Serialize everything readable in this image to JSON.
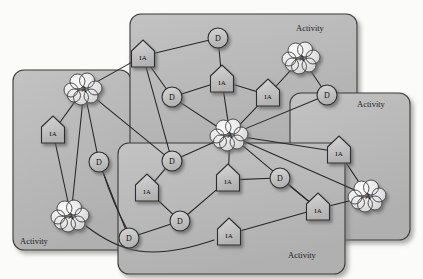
{
  "diagram": {
    "legend_terms": {
      "agent": "A",
      "information_asset": "IA",
      "data": "D"
    },
    "colors": {
      "panel_fill": "#b9b9b9",
      "panel_stroke": "#3a3a3a",
      "node_fill": "#c4c4c4",
      "cloud_fill": "#e9e9e9",
      "edge": "#262626",
      "text": "#111111",
      "background": "#fbfbf9"
    },
    "panels": [
      {
        "id": "p-left",
        "label": "Activity",
        "x": 13,
        "y": 70,
        "w": 118,
        "h": 180,
        "label_x": 20,
        "label_y": 244
      },
      {
        "id": "p-top",
        "label": "Activity",
        "x": 130,
        "y": 14,
        "w": 227,
        "h": 148,
        "label_x": 296,
        "label_y": 31
      },
      {
        "id": "p-right",
        "label": "Activity",
        "x": 290,
        "y": 93,
        "w": 120,
        "h": 147,
        "label_x": 357,
        "label_y": 107
      },
      {
        "id": "p-bottom",
        "label": "Activity",
        "x": 118,
        "y": 143,
        "w": 227,
        "h": 131,
        "label_x": 288,
        "label_y": 258
      }
    ],
    "nodes": [
      {
        "id": "n1",
        "type": "cloud",
        "label": "A",
        "x": 84,
        "y": 89
      },
      {
        "id": "n2",
        "type": "pentagon",
        "label": "IA",
        "x": 53,
        "y": 132
      },
      {
        "id": "n3",
        "type": "circle",
        "label": "D",
        "x": 99,
        "y": 162
      },
      {
        "id": "n4",
        "type": "cloud",
        "label": "A",
        "x": 71,
        "y": 216
      },
      {
        "id": "n5",
        "type": "pentagon",
        "label": "IA",
        "x": 143,
        "y": 56
      },
      {
        "id": "n6",
        "type": "circle",
        "label": "D",
        "x": 218,
        "y": 38
      },
      {
        "id": "n7",
        "type": "circle",
        "label": "D",
        "x": 172,
        "y": 97
      },
      {
        "id": "n8",
        "type": "pentagon",
        "label": "IA",
        "x": 222,
        "y": 81
      },
      {
        "id": "n9",
        "type": "pentagon",
        "label": "IA",
        "x": 268,
        "y": 95
      },
      {
        "id": "n10",
        "type": "cloud",
        "label": "A",
        "x": 302,
        "y": 58
      },
      {
        "id": "n11",
        "type": "circle",
        "label": "D",
        "x": 327,
        "y": 95
      },
      {
        "id": "n12",
        "type": "cloud",
        "label": "A",
        "x": 230,
        "y": 135
      },
      {
        "id": "n13",
        "type": "circle",
        "label": "D",
        "x": 172,
        "y": 161
      },
      {
        "id": "n14",
        "type": "pentagon",
        "label": "IA",
        "x": 147,
        "y": 190
      },
      {
        "id": "n15",
        "type": "circle",
        "label": "D",
        "x": 129,
        "y": 238
      },
      {
        "id": "n16",
        "type": "circle",
        "label": "D",
        "x": 180,
        "y": 221
      },
      {
        "id": "n17",
        "type": "pentagon",
        "label": "IA",
        "x": 228,
        "y": 180
      },
      {
        "id": "n18",
        "type": "circle",
        "label": "D",
        "x": 280,
        "y": 178
      },
      {
        "id": "n19",
        "type": "pentagon",
        "label": "IA",
        "x": 229,
        "y": 234
      },
      {
        "id": "n20",
        "type": "pentagon",
        "label": "IA",
        "x": 318,
        "y": 209
      },
      {
        "id": "n21",
        "type": "pentagon",
        "label": "IA",
        "x": 339,
        "y": 152
      },
      {
        "id": "n22",
        "type": "cloud",
        "label": "A",
        "x": 368,
        "y": 196
      }
    ],
    "edges": [
      {
        "from": "n1",
        "to": "n2"
      },
      {
        "from": "n1",
        "to": "n3"
      },
      {
        "from": "n1",
        "to": "n4"
      },
      {
        "from": "n2",
        "to": "n4"
      },
      {
        "from": "n1",
        "to": "n5"
      },
      {
        "from": "n1",
        "to": "n13"
      },
      {
        "from": "n3",
        "to": "n15"
      },
      {
        "from": "n5",
        "to": "n6"
      },
      {
        "from": "n5",
        "to": "n7"
      },
      {
        "from": "n6",
        "to": "n8"
      },
      {
        "from": "n7",
        "to": "n8"
      },
      {
        "from": "n8",
        "to": "n9"
      },
      {
        "from": "n8",
        "to": "n12"
      },
      {
        "from": "n9",
        "to": "n10"
      },
      {
        "from": "n9",
        "to": "n12"
      },
      {
        "from": "n10",
        "to": "n11"
      },
      {
        "from": "n11",
        "to": "n12"
      },
      {
        "from": "n7",
        "to": "n12"
      },
      {
        "from": "n12",
        "to": "n13"
      },
      {
        "from": "n12",
        "to": "n17"
      },
      {
        "from": "n12",
        "to": "n20"
      },
      {
        "from": "n12",
        "to": "n21"
      },
      {
        "from": "n12",
        "to": "n22"
      },
      {
        "from": "n13",
        "to": "n14"
      },
      {
        "from": "n14",
        "to": "n16"
      },
      {
        "from": "n15",
        "to": "n16"
      },
      {
        "from": "n16",
        "to": "n17"
      },
      {
        "from": "n17",
        "to": "n18"
      },
      {
        "from": "n18",
        "to": "n20"
      },
      {
        "from": "n19",
        "to": "n20"
      },
      {
        "from": "n20",
        "to": "n22"
      },
      {
        "from": "n21",
        "to": "n22"
      },
      {
        "from": "n5",
        "to": "n13"
      }
    ],
    "curved_edges": [
      {
        "id": "c1",
        "from": "n4",
        "to": "n19",
        "path": "M 86 226 C 120 252 150 262 214 240"
      },
      {
        "id": "c2",
        "from": "n3",
        "to": "n15",
        "path": "M 103 172 C 112 200 122 220 127 229"
      }
    ]
  }
}
